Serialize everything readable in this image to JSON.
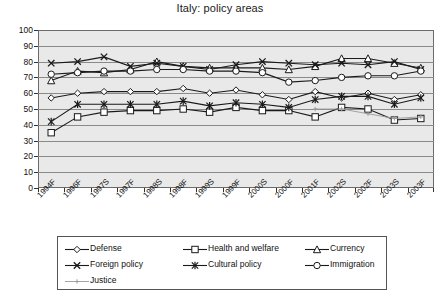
{
  "chart_data": {
    "type": "line",
    "title": "Italy: policy areas",
    "xlabel": "",
    "ylabel": "",
    "ylim": [
      0,
      100
    ],
    "yticks": [
      0,
      10,
      20,
      30,
      40,
      50,
      60,
      70,
      80,
      90,
      100
    ],
    "grid": true,
    "legend_position": "bottom",
    "categories": [
      "1994F",
      "1996F",
      "1997S",
      "1997F",
      "1998S",
      "1998F",
      "1999S",
      "1999F",
      "2000S",
      "2000F",
      "2001F",
      "2002S",
      "2002F",
      "2003S",
      "2003F"
    ],
    "series": [
      {
        "name": "Defense",
        "marker": "diamond",
        "color": "#1a1a1a",
        "values": [
          57,
          60,
          61,
          61,
          61,
          63,
          60,
          62,
          59,
          56,
          61,
          57,
          60,
          56,
          59
        ]
      },
      {
        "name": "Health and welfare",
        "marker": "square",
        "color": "#1a1a1a",
        "values": [
          35,
          45,
          48,
          49,
          49,
          50,
          48,
          51,
          49,
          49,
          45,
          51,
          50,
          43,
          44
        ]
      },
      {
        "name": "Currency",
        "marker": "triangle",
        "color": "#1a1a1a",
        "values": [
          68,
          74,
          73,
          75,
          80,
          77,
          76,
          76,
          76,
          75,
          77,
          82,
          82,
          79,
          76
        ]
      },
      {
        "name": "Foreign policy",
        "marker": "cross",
        "color": "#1a1a1a",
        "values": [
          79,
          80,
          83,
          77,
          79,
          77,
          75,
          78,
          80,
          79,
          78,
          79,
          78,
          80,
          75
        ]
      },
      {
        "name": "Cultural policy",
        "marker": "asterisk",
        "color": "#1a1a1a",
        "values": [
          42,
          53,
          53,
          53,
          53,
          55,
          52,
          54,
          53,
          51,
          56,
          58,
          58,
          53,
          57
        ]
      },
      {
        "name": "Immigration",
        "marker": "circle",
        "color": "#1a1a1a",
        "values": [
          72,
          73,
          74,
          74,
          75,
          75,
          74,
          74,
          73,
          67,
          68,
          70,
          71,
          71,
          74
        ]
      },
      {
        "name": "Justice",
        "marker": "plus",
        "color": "#9a9a9a",
        "values": [
          null,
          null,
          null,
          null,
          null,
          null,
          null,
          null,
          null,
          null,
          50,
          50,
          47,
          44,
          45
        ]
      }
    ]
  },
  "legend": {
    "entries": [
      {
        "label": "Defense",
        "marker": "diamond"
      },
      {
        "label": "Health and welfare",
        "marker": "square"
      },
      {
        "label": "Currency",
        "marker": "triangle"
      },
      {
        "label": "Foreign policy",
        "marker": "cross"
      },
      {
        "label": "Cultural policy",
        "marker": "asterisk"
      },
      {
        "label": "Immigration",
        "marker": "circle"
      },
      {
        "label": "Justice",
        "marker": "plus"
      }
    ]
  },
  "colors": {
    "plot_background": "#e9e9e9",
    "gridline": "#8a8a8a",
    "axis": "#333333",
    "series_dark": "#1a1a1a",
    "series_light": "#9a9a9a",
    "page_background": "#ffffff"
  }
}
